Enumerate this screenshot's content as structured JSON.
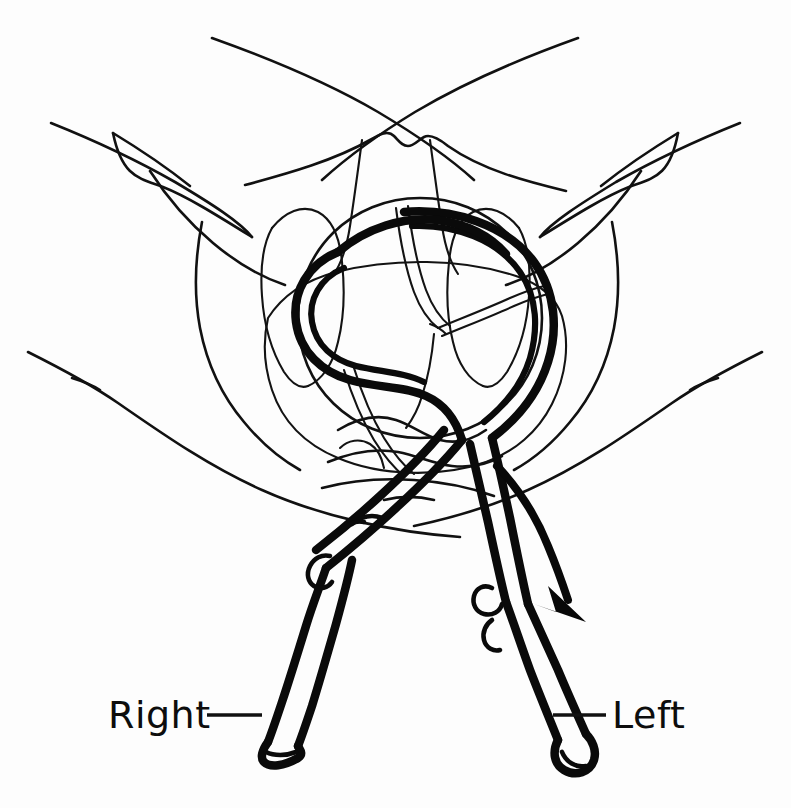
{
  "figure": {
    "background_color": "#fdfdfd",
    "ink_color": "#0a0a0a",
    "width": 791,
    "height": 808,
    "style": "hand-drawn black-and-white line illustration"
  },
  "labels": {
    "right": {
      "text": "Right",
      "x": 108,
      "y": 728,
      "leader": "horizontal dash from label to right forceps handle"
    },
    "left": {
      "text": "Left",
      "x": 612,
      "y": 728,
      "leader": "horizontal dash from label to left forceps handle"
    }
  },
  "annotations": {
    "traction_arrow": {
      "name": "traction-direction-arrow",
      "description": "curved arrow indicating downward-outward traction",
      "direction": "down-right"
    }
  },
  "anatomy": {
    "parts": [
      {
        "name": "left-thigh-contour",
        "stroke": "thin"
      },
      {
        "name": "right-thigh-contour",
        "stroke": "thin"
      },
      {
        "name": "left-buttock-contour",
        "stroke": "thin"
      },
      {
        "name": "right-buttock-contour",
        "stroke": "thin"
      },
      {
        "name": "mons-pubis-contour",
        "stroke": "thin"
      },
      {
        "name": "labia-majora",
        "stroke": "thin"
      },
      {
        "name": "labia-minora",
        "stroke": "thin"
      },
      {
        "name": "perineum",
        "stroke": "thin"
      },
      {
        "name": "fetal-head",
        "stroke": "thin"
      },
      {
        "name": "sagittal-suture",
        "stroke": "thin"
      },
      {
        "name": "lambdoid-suture",
        "stroke": "thin"
      },
      {
        "name": "vaginal-introitus",
        "stroke": "thin"
      }
    ]
  },
  "instrument": {
    "name": "obstetric-forceps",
    "parts": [
      {
        "name": "right-forceps-blade",
        "side": "right",
        "stroke": "thick"
      },
      {
        "name": "left-forceps-blade",
        "side": "left",
        "stroke": "thick"
      },
      {
        "name": "right-forceps-shank",
        "side": "right",
        "stroke": "thick"
      },
      {
        "name": "left-forceps-shank",
        "side": "left",
        "stroke": "thick"
      },
      {
        "name": "forceps-lock",
        "side": "center",
        "stroke": "thick"
      },
      {
        "name": "right-forceps-handle",
        "side": "right",
        "stroke": "thick"
      },
      {
        "name": "left-forceps-handle",
        "side": "left",
        "stroke": "thick"
      },
      {
        "name": "right-finger-guard",
        "side": "right",
        "stroke": "thick"
      },
      {
        "name": "left-finger-guard",
        "side": "left",
        "stroke": "thick"
      }
    ]
  }
}
